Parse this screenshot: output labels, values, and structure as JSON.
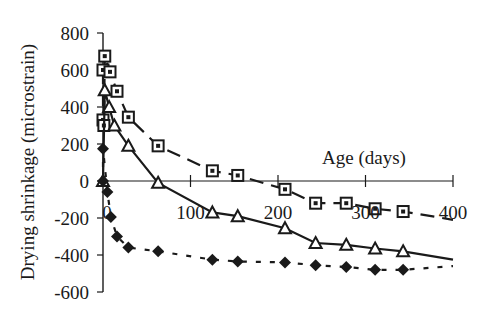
{
  "chart_data": {
    "type": "line",
    "title": "",
    "xlabel": "Age (days)",
    "ylabel": "Drying shrinkage (microstrain)",
    "xlim": [
      0,
      400
    ],
    "ylim": [
      -600,
      800
    ],
    "x_ticks": [
      0,
      100,
      200,
      300,
      400
    ],
    "y_ticks": [
      800,
      600,
      400,
      200,
      0,
      -200,
      -400,
      -600
    ],
    "grid": false,
    "legend": null,
    "series": [
      {
        "name": "square-series",
        "marker": "square",
        "line": "dashed",
        "points": [
          [
            0,
            600
          ],
          [
            0,
            330
          ],
          [
            1,
            300
          ],
          [
            2,
            675
          ],
          [
            8,
            590
          ],
          [
            16,
            485
          ],
          [
            29,
            345
          ],
          [
            63,
            190
          ],
          [
            125,
            55
          ],
          [
            154,
            30
          ],
          [
            208,
            -45
          ],
          [
            243,
            -120
          ],
          [
            278,
            -120
          ],
          [
            311,
            -150
          ],
          [
            343,
            -165
          ],
          [
            400,
            -210
          ]
        ]
      },
      {
        "name": "triangle-series",
        "marker": "triangle",
        "line": "solid",
        "points": [
          [
            0,
            0
          ],
          [
            2,
            490
          ],
          [
            7,
            400
          ],
          [
            13,
            300
          ],
          [
            29,
            190
          ],
          [
            63,
            -10
          ],
          [
            125,
            -170
          ],
          [
            154,
            -190
          ],
          [
            208,
            -255
          ],
          [
            243,
            -335
          ],
          [
            278,
            -345
          ],
          [
            311,
            -365
          ],
          [
            343,
            -380
          ],
          [
            400,
            -425
          ]
        ]
      },
      {
        "name": "diamond-series",
        "marker": "diamond",
        "line": "dotted",
        "points": [
          [
            0,
            0
          ],
          [
            0,
            175
          ],
          [
            5,
            -60
          ],
          [
            9,
            -195
          ],
          [
            16,
            -300
          ],
          [
            29,
            -360
          ],
          [
            63,
            -380
          ],
          [
            125,
            -425
          ],
          [
            154,
            -435
          ],
          [
            208,
            -440
          ],
          [
            243,
            -455
          ],
          [
            278,
            -465
          ],
          [
            311,
            -480
          ],
          [
            343,
            -480
          ],
          [
            400,
            -460
          ]
        ]
      }
    ]
  },
  "labels": {
    "ylabel": "Drying shrinkage (microstrain)",
    "xlabel": "Age (days)",
    "y_ticks": [
      "800",
      "600",
      "400",
      "200",
      "0",
      "-200",
      "-400",
      "-600"
    ],
    "x_ticks": [
      "0",
      "100",
      "200",
      "300",
      "400"
    ]
  }
}
